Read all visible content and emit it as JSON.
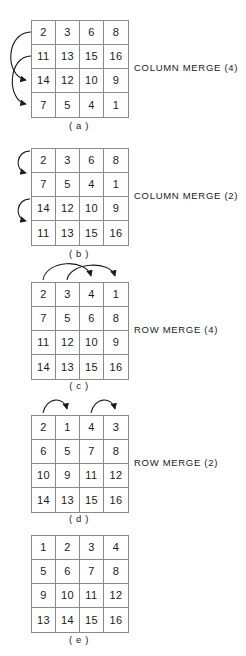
{
  "figure": {
    "title_present": false,
    "panels": [
      {
        "id": "a",
        "caption": "( a )",
        "side_label": "COLUMN MERGE (4)",
        "rows": [
          [
            "2",
            "3",
            "6",
            "8"
          ],
          [
            "11",
            "13",
            "15",
            "16"
          ],
          [
            "14",
            "12",
            "10",
            "9"
          ],
          [
            "7",
            "5",
            "4",
            "1"
          ]
        ],
        "arrows": [
          {
            "name": "arrow-row1-to-row3",
            "from_row": 1,
            "to_row": 3
          },
          {
            "name": "arrow-row2-to-row4",
            "from_row": 2,
            "to_row": 4
          }
        ]
      },
      {
        "id": "b",
        "caption": "( b )",
        "side_label": "COLUMN MERGE (2)",
        "rows": [
          [
            "2",
            "3",
            "6",
            "8"
          ],
          [
            "7",
            "5",
            "4",
            "1"
          ],
          [
            "14",
            "12",
            "10",
            "9"
          ],
          [
            "11",
            "13",
            "15",
            "16"
          ]
        ],
        "arrows": [
          {
            "name": "arrow-row1-to-row2",
            "from_row": 1,
            "to_row": 2
          },
          {
            "name": "arrow-row3-to-row4",
            "from_row": 3,
            "to_row": 4
          }
        ]
      },
      {
        "id": "c",
        "caption": "( c )",
        "side_label": "ROW MERGE (4)",
        "rows": [
          [
            "2",
            "3",
            "4",
            "1"
          ],
          [
            "7",
            "5",
            "6",
            "8"
          ],
          [
            "11",
            "12",
            "10",
            "9"
          ],
          [
            "14",
            "13",
            "15",
            "16"
          ]
        ],
        "arrows": [
          {
            "name": "arrow-col1-to-col3",
            "from_col": 1,
            "to_col": 3
          },
          {
            "name": "arrow-col2-to-col4",
            "from_col": 2,
            "to_col": 4
          }
        ]
      },
      {
        "id": "d",
        "caption": "( d )",
        "side_label": "ROW MERGE (2)",
        "rows": [
          [
            "2",
            "1",
            "4",
            "3"
          ],
          [
            "6",
            "5",
            "7",
            "8"
          ],
          [
            "10",
            "9",
            "11",
            "12"
          ],
          [
            "14",
            "13",
            "15",
            "16"
          ]
        ],
        "arrows": [
          {
            "name": "arrow-col1-to-col2",
            "from_col": 1,
            "to_col": 2
          },
          {
            "name": "arrow-col3-to-col4",
            "from_col": 3,
            "to_col": 4
          }
        ]
      },
      {
        "id": "e",
        "caption": "( e )",
        "side_label": "",
        "rows": [
          [
            "1",
            "2",
            "3",
            "4"
          ],
          [
            "5",
            "6",
            "7",
            "8"
          ],
          [
            "9",
            "10",
            "11",
            "12"
          ],
          [
            "13",
            "14",
            "15",
            "16"
          ]
        ],
        "arrows": []
      }
    ],
    "colors": {
      "grid_line": "#8a8a8a",
      "text": "#1a1a1a",
      "arrow": "#1a1a1a",
      "background": "#ffffff"
    }
  }
}
